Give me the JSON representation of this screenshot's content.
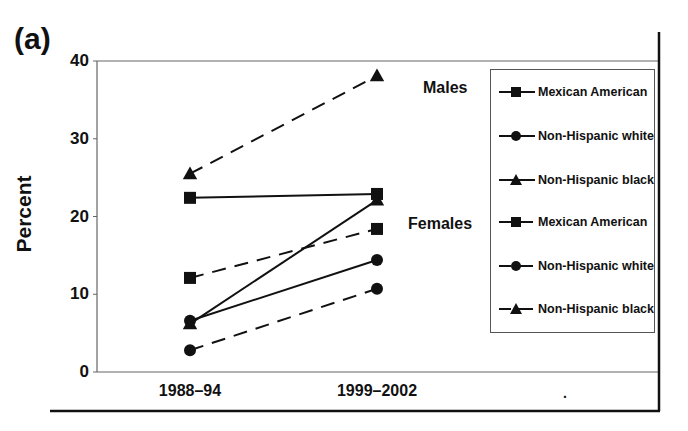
{
  "figure": {
    "panel_label": "(a)",
    "group_labels": {
      "males": "Males",
      "females": "Females"
    },
    "stray_mark": "."
  },
  "chart_data": {
    "type": "line",
    "title": "",
    "panel": "(a)",
    "xlabel": "",
    "ylabel": "Percent",
    "categories": [
      "1988–94",
      "1999–2002"
    ],
    "ylim": [
      0,
      40
    ],
    "yticks": [
      0,
      10,
      20,
      30,
      40
    ],
    "grid": false,
    "legend_position": "right (boxed)",
    "series": [
      {
        "name": "Mexican American",
        "group": "Males",
        "line": "solid",
        "marker": "square",
        "values": [
          22.4,
          22.9
        ]
      },
      {
        "name": "Non-Hispanic white",
        "group": "Males",
        "line": "solid",
        "marker": "circle",
        "values": [
          6.6,
          14.4
        ]
      },
      {
        "name": "Non-Hispanic black",
        "group": "Males",
        "line": "solid",
        "marker": "triangle",
        "values": [
          6.2,
          22.1
        ]
      },
      {
        "name": "Mexican American",
        "group": "Females",
        "line": "dashed",
        "marker": "square",
        "values": [
          12.1,
          18.4
        ]
      },
      {
        "name": "Non-Hispanic white",
        "group": "Females",
        "line": "dashed",
        "marker": "circle",
        "values": [
          2.8,
          10.7
        ]
      },
      {
        "name": "Non-Hispanic black",
        "group": "Females",
        "line": "dashed",
        "marker": "triangle",
        "values": [
          25.5,
          38.1
        ]
      }
    ],
    "annotations": [
      "Males",
      "Females"
    ]
  },
  "legend": {
    "items": [
      {
        "label": "Mexican American",
        "line": "solid",
        "marker": "square"
      },
      {
        "label": "Non-Hispanic white",
        "line": "solid",
        "marker": "circle"
      },
      {
        "label": "Non-Hispanic black",
        "line": "solid",
        "marker": "triangle"
      },
      {
        "label": "Mexican American",
        "line": "dashed",
        "marker": "square"
      },
      {
        "label": "Non-Hispanic white",
        "line": "dashed",
        "marker": "circle"
      },
      {
        "label": "Non-Hispanic black",
        "line": "dashed",
        "marker": "triangle"
      }
    ]
  },
  "colors": {
    "ink": "#111111",
    "frame": "#555555",
    "background": "#ffffff"
  }
}
